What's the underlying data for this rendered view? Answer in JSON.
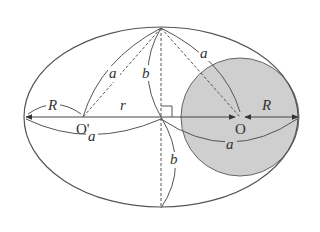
{
  "diagram": {
    "title": "",
    "type": "ellipse-geometry",
    "colors": {
      "stroke": "#555555",
      "circle_fill": "#cfcfcf",
      "text": "#333333"
    },
    "shapes": {
      "ellipse": {
        "cx": 161,
        "cy": 117,
        "rx": 137,
        "ry": 90
      },
      "circle": {
        "cx": 240,
        "cy": 117,
        "r": 59
      }
    },
    "points": {
      "O_prime": {
        "label": "O'",
        "x": 83,
        "y": 117
      },
      "O": {
        "label": "O",
        "x": 240,
        "y": 117
      },
      "top_vertex": {
        "x": 161,
        "y": 28
      },
      "bottom_vertex": {
        "x": 161,
        "y": 208
      },
      "center": {
        "x": 161,
        "y": 117
      }
    },
    "labels": {
      "a_left_upper": "a",
      "a_right_upper": "a",
      "a_left_lower": "a",
      "a_right_lower": "a",
      "b_upper": "b",
      "b_lower": "b",
      "R_left": "R",
      "R_right": "R",
      "r": "r",
      "O_prime": "O'",
      "O": "O"
    }
  }
}
